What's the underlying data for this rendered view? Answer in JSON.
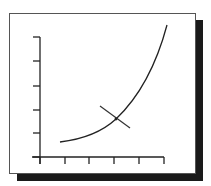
{
  "diagram": {
    "type": "tangent-line-on-exponential-curve",
    "frame": {
      "x": 9,
      "y": 13,
      "w": 187,
      "h": 161,
      "border_color": "#555555",
      "shadow_color": "#1a1a1a"
    },
    "axes": {
      "origin": [
        40,
        157
      ],
      "y_axis": {
        "top": 37,
        "ticks_y": [
          37,
          61,
          86,
          110,
          133,
          157
        ]
      },
      "x_axis": {
        "left": 32,
        "right": 164,
        "ticks_x": [
          40,
          65,
          89,
          114,
          139,
          164
        ]
      }
    },
    "curve": {
      "path": "M60,142 C85,139 103,131 116,119 C136,100 155,70 167,25"
    },
    "tangent": {
      "x1": 100,
      "y1": 106,
      "x2": 130,
      "y2": 128
    },
    "tangent_point": {
      "x": 116,
      "y": 119
    }
  },
  "chart_data": {
    "type": "line",
    "title": "",
    "xlabel": "",
    "ylabel": "",
    "x_ticks": 6,
    "y_ticks": 6,
    "series": [
      {
        "name": "curve",
        "points": [
          [
            0.8,
            0.6
          ],
          [
            2,
            1.2
          ],
          [
            3,
            1.5
          ],
          [
            4,
            2.8
          ],
          [
            5,
            5.0
          ]
        ]
      },
      {
        "name": "tangent",
        "points": [
          [
            2.4,
            2.1
          ],
          [
            3.6,
            1.2
          ]
        ]
      }
    ],
    "grid": false,
    "legend": "none"
  }
}
